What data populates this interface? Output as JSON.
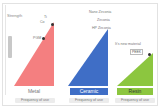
{
  "y_axis": {
    "label": "Strength"
  },
  "columns": [
    {
      "category": "Metal",
      "color": "#f47f80",
      "x_label": "Frequency of use",
      "annotations": [
        "Ti",
        "Co",
        "PGM"
      ]
    },
    {
      "category": "Ceramic",
      "color": "#3f6ec6",
      "x_label": "Frequency of use",
      "annotations": [
        "Nano Zirconia",
        "Zirconia",
        "HP Zirconia"
      ]
    },
    {
      "category": "Resin",
      "color": "#8cc63f",
      "x_label": "Frequency of use",
      "annotations": [
        "It's new material",
        "PEEK"
      ]
    }
  ]
}
